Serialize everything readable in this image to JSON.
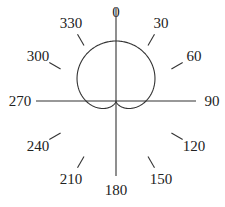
{
  "chart_data": {
    "type": "line",
    "subtype": "polar",
    "title": "",
    "equation": "r = 1 + cos(theta)",
    "angle_zero": "top",
    "angle_direction": "clockwise",
    "angle_ticks": [
      0,
      30,
      60,
      90,
      120,
      150,
      180,
      210,
      240,
      270,
      300,
      330
    ],
    "angle_tick_labels": [
      "0",
      "30",
      "60",
      "90",
      "120",
      "150",
      "180",
      "210",
      "240",
      "270",
      "300",
      "330"
    ],
    "series": [
      {
        "name": "cardioid",
        "theta_deg": [
          0,
          30,
          60,
          90,
          120,
          150,
          180,
          210,
          240,
          270,
          300,
          330,
          360
        ],
        "r": [
          2.0,
          1.866,
          1.5,
          1.0,
          0.5,
          0.134,
          0.0,
          0.134,
          0.5,
          1.0,
          1.5,
          1.866,
          2.0
        ]
      }
    ],
    "grid": false,
    "legend": "none"
  }
}
